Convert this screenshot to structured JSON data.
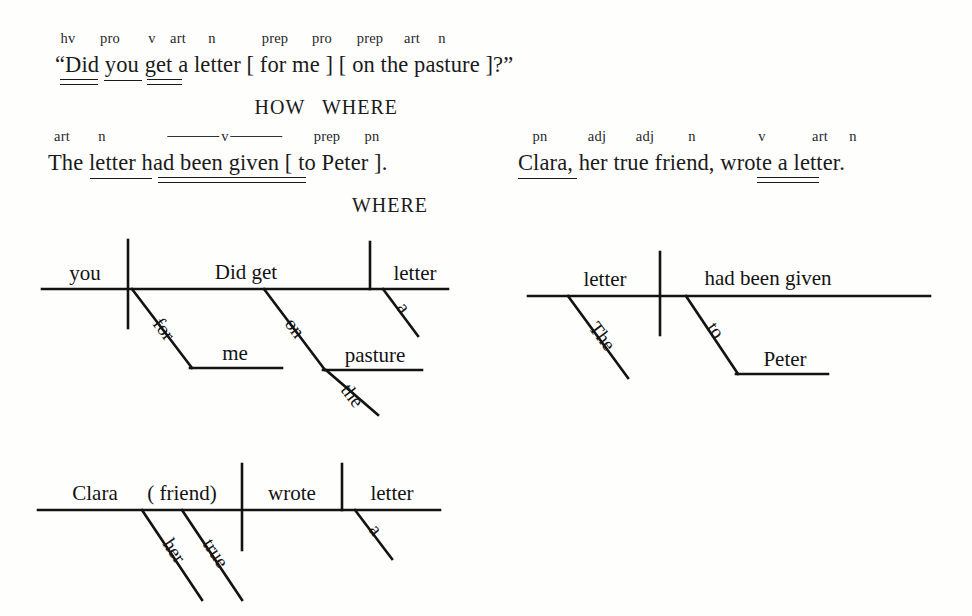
{
  "page": {
    "background_color": "#fefefd",
    "ink_color": "#131313"
  },
  "sentences": [
    {
      "id": "sentence-1",
      "text": "“Did you get a letter [ for me ] [ on the pasture ]?”",
      "pos_tags": [
        {
          "label": "hv",
          "x": 68
        },
        {
          "label": "pro",
          "x": 110
        },
        {
          "label": "v",
          "x": 152
        },
        {
          "label": "art",
          "x": 178
        },
        {
          "label": "n",
          "x": 212
        },
        {
          "label": "prep",
          "x": 275
        },
        {
          "label": "pro",
          "x": 322
        },
        {
          "label": "prep",
          "x": 370
        },
        {
          "label": "art",
          "x": 412
        },
        {
          "label": "n",
          "x": 442
        }
      ],
      "underlines": [
        {
          "word": "Did",
          "type": "double",
          "x": 60,
          "width": 38
        },
        {
          "word": "you",
          "type": "single",
          "x": 104,
          "width": 38
        },
        {
          "word": "get",
          "type": "double",
          "x": 147,
          "width": 35
        }
      ],
      "function_tags": [
        {
          "label": "HOW",
          "x": 280
        },
        {
          "label": "WHERE",
          "x": 358
        }
      ]
    },
    {
      "id": "sentence-2",
      "text": "The letter had been given [ to Peter ].",
      "pos_tags": [
        {
          "label": "art",
          "x": 62
        },
        {
          "label": "n",
          "x": 102
        },
        {
          "label": "prep",
          "x": 327
        },
        {
          "label": "pn",
          "x": 370
        }
      ],
      "pos_spans": [
        {
          "label": "v",
          "x": 225,
          "rule_width": 52
        }
      ],
      "underlines": [
        {
          "word": "letter",
          "type": "single",
          "x": 90,
          "width": 62
        },
        {
          "word": "had been given",
          "type": "double",
          "x": 158,
          "width": 148
        }
      ],
      "function_tags": [
        {
          "label": "WHERE",
          "x": 388
        }
      ]
    },
    {
      "id": "sentence-3",
      "text": "Clara, her true friend, wrote a letter.",
      "pos_tags": [
        {
          "label": "pn",
          "x": 540
        },
        {
          "label": "adj",
          "x": 597
        },
        {
          "label": "adj",
          "x": 645
        },
        {
          "label": "n",
          "x": 692
        },
        {
          "label": "v",
          "x": 762
        },
        {
          "label": "art",
          "x": 820
        },
        {
          "label": "n",
          "x": 853
        }
      ],
      "underlines": [
        {
          "word": "Clara",
          "type": "single",
          "x": 518,
          "width": 59
        },
        {
          "word": "wrote",
          "type": "double",
          "x": 757,
          "width": 62
        }
      ],
      "function_tags": []
    }
  ],
  "diagrams": [
    {
      "id": "diagram-1",
      "source_sentence": "“Did you get a letter [ for me ] [ on the pasture ]?”",
      "labels": [
        {
          "role": "subject",
          "text": "you"
        },
        {
          "role": "verb",
          "text": "Did get"
        },
        {
          "role": "direct-object",
          "text": "letter"
        },
        {
          "role": "preposition",
          "text": "for"
        },
        {
          "role": "object-of-prep",
          "text": "me"
        },
        {
          "role": "preposition",
          "text": "on"
        },
        {
          "role": "object-of-prep",
          "text": "pasture"
        },
        {
          "role": "article-modifier",
          "text": "the"
        },
        {
          "role": "article-modifier",
          "text": "a"
        }
      ]
    },
    {
      "id": "diagram-2",
      "source_sentence": "The letter had been given [ to Peter ].",
      "labels": [
        {
          "role": "subject",
          "text": "letter"
        },
        {
          "role": "verb",
          "text": "had been given"
        },
        {
          "role": "article-modifier",
          "text": "The"
        },
        {
          "role": "preposition",
          "text": "to"
        },
        {
          "role": "object-of-prep",
          "text": "Peter"
        }
      ]
    },
    {
      "id": "diagram-3",
      "source_sentence": "Clara, her true friend, wrote a letter.",
      "labels": [
        {
          "role": "subject",
          "text": "Clara"
        },
        {
          "role": "appositive",
          "text": "( friend)"
        },
        {
          "role": "verb",
          "text": "wrote"
        },
        {
          "role": "direct-object",
          "text": "letter"
        },
        {
          "role": "adjective",
          "text": "her"
        },
        {
          "role": "adjective",
          "text": "true"
        },
        {
          "role": "article-modifier",
          "text": "a"
        }
      ]
    }
  ]
}
